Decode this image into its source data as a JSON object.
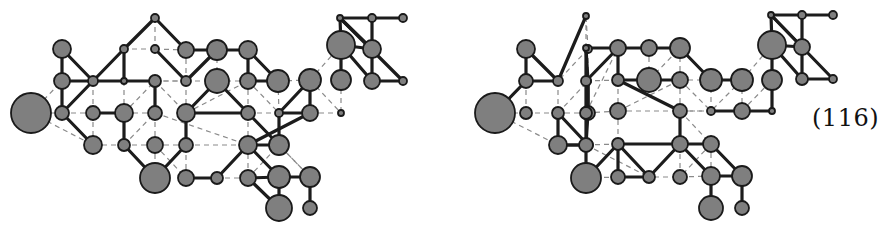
{
  "equation_label": "(116)",
  "colors": {
    "node_fill": "#7f7f7f",
    "node_stroke": "#1a1a1a",
    "edge": "#1c1c1c",
    "dashed": "#8a8a8a"
  },
  "figures": [
    {
      "name": "left-graph",
      "nodes": {
        "A": [
          31,
          113,
          20
        ],
        "B": [
          62,
          49,
          9
        ],
        "C": [
          62,
          81,
          8
        ],
        "D": [
          62,
          113,
          7
        ],
        "E": [
          93,
          81,
          5
        ],
        "F": [
          93,
          113,
          7
        ],
        "G": [
          93,
          145,
          9
        ],
        "H": [
          124,
          49,
          4
        ],
        "I": [
          124,
          81,
          3
        ],
        "J": [
          124,
          113,
          9
        ],
        "K": [
          124,
          145,
          6
        ],
        "L": [
          155,
          18,
          4
        ],
        "M": [
          155,
          49,
          4
        ],
        "N": [
          155,
          81,
          6
        ],
        "O": [
          155,
          113,
          7
        ],
        "P": [
          155,
          145,
          8
        ],
        "Q": [
          155,
          178,
          15
        ],
        "R": [
          186,
          50,
          8
        ],
        "S": [
          186,
          81,
          5
        ],
        "T": [
          186,
          113,
          9
        ],
        "U": [
          186,
          145,
          7
        ],
        "V": [
          186,
          178,
          8
        ],
        "W": [
          217,
          50,
          10
        ],
        "X": [
          217,
          81,
          12
        ],
        "Y": [
          217,
          178,
          6
        ],
        "Z": [
          248,
          50,
          9
        ],
        "a": [
          248,
          81,
          8
        ],
        "b": [
          248,
          113,
          7
        ],
        "c": [
          248,
          145,
          9
        ],
        "d": [
          248,
          178,
          8
        ],
        "e": [
          278,
          81,
          11
        ],
        "f": [
          279,
          113,
          4
        ],
        "g": [
          279,
          145,
          10
        ],
        "h": [
          279,
          177,
          11
        ],
        "i": [
          279,
          208,
          13
        ],
        "j": [
          310,
          80,
          11
        ],
        "k": [
          310,
          113,
          8
        ],
        "l": [
          310,
          177,
          10
        ],
        "m": [
          310,
          208,
          7
        ],
        "n": [
          341,
          45,
          14
        ],
        "o": [
          341,
          80,
          10
        ],
        "p": [
          341,
          113,
          3
        ],
        "q": [
          340,
          18,
          3
        ],
        "r": [
          372,
          18,
          4
        ],
        "s": [
          403,
          18,
          4
        ],
        "t": [
          372,
          49,
          9
        ],
        "u": [
          372,
          81,
          8
        ],
        "v": [
          403,
          81,
          4
        ]
      },
      "edges": [
        [
          "B",
          "C"
        ],
        [
          "C",
          "D"
        ],
        [
          "B",
          "E"
        ],
        [
          "C",
          "E"
        ],
        [
          "D",
          "E"
        ],
        [
          "E",
          "I"
        ],
        [
          "E",
          "H"
        ],
        [
          "H",
          "I"
        ],
        [
          "H",
          "L"
        ],
        [
          "L",
          "R"
        ],
        [
          "M",
          "S"
        ],
        [
          "S",
          "W"
        ],
        [
          "W",
          "Z"
        ],
        [
          "R",
          "W"
        ],
        [
          "D",
          "G"
        ],
        [
          "F",
          "J"
        ],
        [
          "J",
          "K"
        ],
        [
          "K",
          "Q"
        ],
        [
          "N",
          "O"
        ],
        [
          "N",
          "I"
        ],
        [
          "Q",
          "U"
        ],
        [
          "U",
          "T"
        ],
        [
          "T",
          "X"
        ],
        [
          "T",
          "b"
        ],
        [
          "X",
          "b"
        ],
        [
          "V",
          "Y"
        ],
        [
          "Y",
          "c"
        ],
        [
          "c",
          "g"
        ],
        [
          "c",
          "h"
        ],
        [
          "c",
          "k"
        ],
        [
          "g",
          "b"
        ],
        [
          "g",
          "f"
        ],
        [
          "f",
          "k"
        ],
        [
          "k",
          "j"
        ],
        [
          "Z",
          "a"
        ],
        [
          "a",
          "e"
        ],
        [
          "e",
          "Z"
        ],
        [
          "h",
          "l"
        ],
        [
          "h",
          "i"
        ],
        [
          "d",
          "i"
        ],
        [
          "d",
          "h"
        ],
        [
          "l",
          "m"
        ],
        [
          "j",
          "f"
        ],
        [
          "o",
          "n"
        ],
        [
          "q",
          "r"
        ],
        [
          "r",
          "s"
        ],
        [
          "q",
          "n"
        ],
        [
          "n",
          "t"
        ],
        [
          "q",
          "t"
        ],
        [
          "r",
          "t"
        ],
        [
          "t",
          "u"
        ],
        [
          "n",
          "u"
        ],
        [
          "u",
          "v"
        ],
        [
          "q",
          "v"
        ]
      ],
      "dashed": [
        [
          "A",
          "C"
        ],
        [
          "A",
          "D"
        ],
        [
          "A",
          "G"
        ],
        [
          "D",
          "F"
        ],
        [
          "F",
          "G"
        ],
        [
          "F",
          "E"
        ],
        [
          "I",
          "N"
        ],
        [
          "N",
          "S"
        ],
        [
          "I",
          "J"
        ],
        [
          "J",
          "N"
        ],
        [
          "J",
          "O"
        ],
        [
          "G",
          "K"
        ],
        [
          "K",
          "O"
        ],
        [
          "O",
          "P"
        ],
        [
          "P",
          "Q"
        ],
        [
          "P",
          "U"
        ],
        [
          "P",
          "K"
        ],
        [
          "L",
          "M"
        ],
        [
          "M",
          "H"
        ],
        [
          "M",
          "R"
        ],
        [
          "M",
          "S"
        ],
        [
          "R",
          "S"
        ],
        [
          "S",
          "X"
        ],
        [
          "S",
          "T"
        ],
        [
          "S",
          "N"
        ],
        [
          "T",
          "U"
        ],
        [
          "U",
          "c"
        ],
        [
          "T",
          "a"
        ],
        [
          "X",
          "a"
        ],
        [
          "X",
          "W"
        ],
        [
          "a",
          "b"
        ],
        [
          "b",
          "c"
        ],
        [
          "c",
          "d"
        ],
        [
          "d",
          "Y"
        ],
        [
          "b",
          "f"
        ],
        [
          "a",
          "f"
        ],
        [
          "e",
          "f"
        ],
        [
          "e",
          "j"
        ],
        [
          "j",
          "n"
        ],
        [
          "j",
          "p"
        ],
        [
          "k",
          "p"
        ],
        [
          "o",
          "p"
        ],
        [
          "g",
          "l"
        ],
        [
          "N",
          "T"
        ],
        [
          "O",
          "c"
        ],
        [
          "V",
          "U"
        ],
        [
          "P",
          "V"
        ],
        [
          "l",
          "g"
        ],
        [
          "d",
          "g"
        ]
      ]
    },
    {
      "name": "right-graph",
      "nodes": {
        "A": [
          495,
          113,
          20
        ],
        "B": [
          526,
          49,
          9
        ],
        "C": [
          526,
          81,
          7
        ],
        "D": [
          526,
          113,
          6
        ],
        "E": [
          558,
          81,
          5
        ],
        "F": [
          558,
          113,
          6
        ],
        "G": [
          558,
          145,
          9
        ],
        "H": [
          588,
          49,
          4
        ],
        "I": [
          588,
          81,
          3
        ],
        "J": [
          588,
          113,
          7
        ],
        "K": [
          588,
          145,
          5
        ],
        "L": [
          586,
          16,
          3
        ],
        "M": [
          586,
          48,
          3
        ],
        "N": [
          586,
          81,
          5
        ],
        "O": [
          586,
          113,
          6
        ],
        "P": [
          586,
          145,
          7
        ],
        "Q": [
          586,
          178,
          15
        ],
        "R": [
          618,
          48,
          8
        ],
        "S": [
          618,
          80,
          6
        ],
        "T": [
          618,
          111,
          8
        ],
        "U": [
          618,
          144,
          6
        ],
        "V": [
          618,
          177,
          7
        ],
        "W": [
          649,
          48,
          8
        ],
        "X": [
          649,
          80,
          12
        ],
        "Y": [
          649,
          177,
          6
        ],
        "Z": [
          680,
          48,
          10
        ],
        "a": [
          680,
          80,
          8
        ],
        "b": [
          680,
          111,
          7
        ],
        "c": [
          680,
          144,
          8
        ],
        "d": [
          680,
          177,
          7
        ],
        "e": [
          711,
          80,
          11
        ],
        "f": [
          711,
          111,
          4
        ],
        "g": [
          711,
          144,
          8
        ],
        "h": [
          711,
          176,
          9
        ],
        "i": [
          711,
          208,
          12
        ],
        "j": [
          742,
          80,
          11
        ],
        "k": [
          742,
          111,
          8
        ],
        "l": [
          742,
          176,
          10
        ],
        "m": [
          742,
          208,
          7
        ],
        "n": [
          772,
          45,
          14
        ],
        "o": [
          772,
          80,
          10
        ],
        "p": [
          772,
          111,
          3
        ],
        "q": [
          771,
          15,
          3
        ],
        "r": [
          802,
          15,
          4
        ],
        "s": [
          833,
          15,
          4
        ],
        "t": [
          802,
          47,
          8
        ],
        "u": [
          802,
          79,
          6
        ],
        "v": [
          833,
          79,
          4
        ]
      },
      "edges": [
        [
          "B",
          "C"
        ],
        [
          "C",
          "A"
        ],
        [
          "B",
          "E"
        ],
        [
          "C",
          "E"
        ],
        [
          "E",
          "L"
        ],
        [
          "F",
          "K"
        ],
        [
          "K",
          "G"
        ],
        [
          "G",
          "K"
        ],
        [
          "J",
          "I"
        ],
        [
          "I",
          "M"
        ],
        [
          "I",
          "J"
        ],
        [
          "M",
          "N"
        ],
        [
          "N",
          "O"
        ],
        [
          "M",
          "W"
        ],
        [
          "W",
          "Z"
        ],
        [
          "Z",
          "e"
        ],
        [
          "J",
          "O"
        ],
        [
          "J",
          "P"
        ],
        [
          "O",
          "P"
        ],
        [
          "N",
          "R"
        ],
        [
          "R",
          "S"
        ],
        [
          "P",
          "Q"
        ],
        [
          "Q",
          "U"
        ],
        [
          "U",
          "V"
        ],
        [
          "U",
          "Y"
        ],
        [
          "Y",
          "c"
        ],
        [
          "V",
          "Y"
        ],
        [
          "U",
          "c"
        ],
        [
          "c",
          "b"
        ],
        [
          "b",
          "S"
        ],
        [
          "S",
          "X"
        ],
        [
          "X",
          "a"
        ],
        [
          "e",
          "j"
        ],
        [
          "c",
          "g"
        ],
        [
          "c",
          "h"
        ],
        [
          "g",
          "l"
        ],
        [
          "h",
          "l"
        ],
        [
          "h",
          "i"
        ],
        [
          "l",
          "m"
        ],
        [
          "f",
          "k"
        ],
        [
          "k",
          "p"
        ],
        [
          "o",
          "p"
        ],
        [
          "o",
          "n"
        ],
        [
          "q",
          "r"
        ],
        [
          "r",
          "s"
        ],
        [
          "q",
          "n"
        ],
        [
          "n",
          "t"
        ],
        [
          "q",
          "t"
        ],
        [
          "r",
          "t"
        ],
        [
          "t",
          "u"
        ],
        [
          "n",
          "u"
        ],
        [
          "u",
          "v"
        ],
        [
          "q",
          "v"
        ],
        [
          "K",
          "P"
        ],
        [
          "F",
          "G"
        ]
      ],
      "dashed": [
        [
          "A",
          "D"
        ],
        [
          "A",
          "G"
        ],
        [
          "D",
          "F"
        ],
        [
          "C",
          "D"
        ],
        [
          "E",
          "F"
        ],
        [
          "F",
          "I"
        ],
        [
          "I",
          "H"
        ],
        [
          "H",
          "E"
        ],
        [
          "H",
          "L"
        ],
        [
          "L",
          "M"
        ],
        [
          "M",
          "H"
        ],
        [
          "I",
          "N"
        ],
        [
          "J",
          "F"
        ],
        [
          "K",
          "O"
        ],
        [
          "O",
          "R"
        ],
        [
          "N",
          "S"
        ],
        [
          "S",
          "T"
        ],
        [
          "T",
          "U"
        ],
        [
          "T",
          "O"
        ],
        [
          "T",
          "a"
        ],
        [
          "a",
          "b"
        ],
        [
          "a",
          "f"
        ],
        [
          "f",
          "b"
        ],
        [
          "b",
          "g"
        ],
        [
          "g",
          "c"
        ],
        [
          "g",
          "d"
        ],
        [
          "d",
          "c"
        ],
        [
          "d",
          "h"
        ],
        [
          "f",
          "e"
        ],
        [
          "e",
          "a"
        ],
        [
          "j",
          "k"
        ],
        [
          "j",
          "f"
        ],
        [
          "j",
          "n"
        ],
        [
          "k",
          "o"
        ],
        [
          "R",
          "W"
        ],
        [
          "W",
          "X"
        ],
        [
          "X",
          "Z"
        ],
        [
          "Z",
          "a"
        ],
        [
          "Q",
          "V"
        ],
        [
          "P",
          "U"
        ],
        [
          "V",
          "d"
        ],
        [
          "U",
          "g"
        ],
        [
          "T",
          "k"
        ],
        [
          "P",
          "Y"
        ],
        [
          "h",
          "g"
        ]
      ]
    }
  ]
}
